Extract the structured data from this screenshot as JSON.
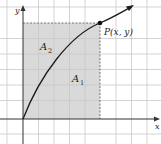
{
  "diagram": {
    "axes": {
      "x_label": "x",
      "y_label": "y"
    },
    "point_label": "P(x, y)",
    "regions": [
      {
        "name": "A",
        "sub": "1"
      },
      {
        "name": "A",
        "sub": "2"
      }
    ],
    "colors": {
      "shade": "#d9d9d9",
      "grid": "#c8c8c8",
      "curve": "#1a1a1a",
      "axis": "#333333"
    }
  }
}
